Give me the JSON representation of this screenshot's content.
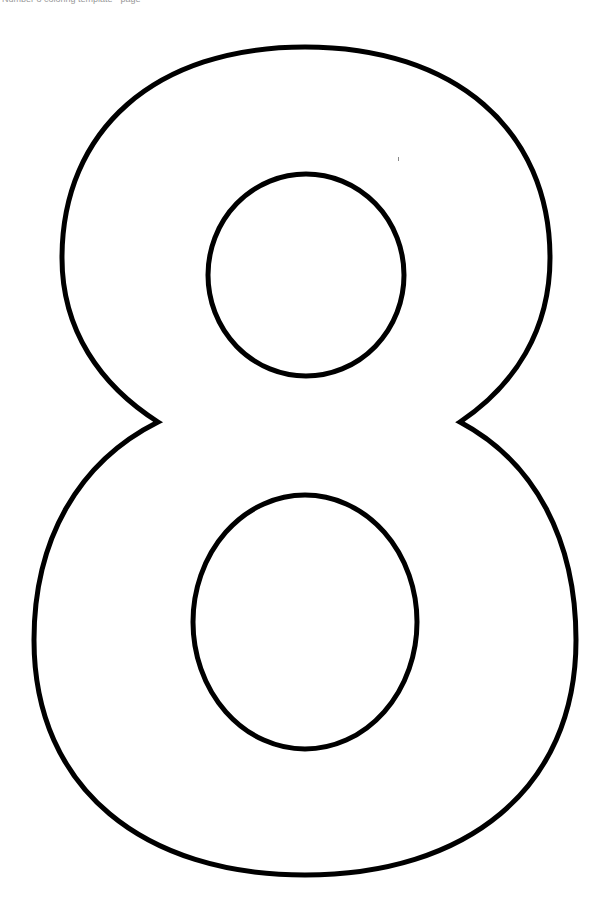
{
  "page": {
    "header_text": "Number 8 coloring template - page"
  },
  "figure": {
    "glyph": "8",
    "style": "outline",
    "stroke_color": "#000000",
    "fill_color": "#ffffff"
  }
}
